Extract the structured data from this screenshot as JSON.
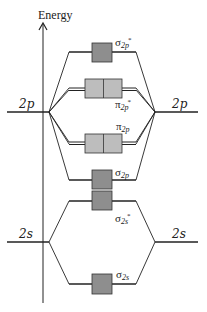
{
  "axis": {
    "title": "Energy"
  },
  "atomic_orbitals": {
    "left_2p": "2p",
    "right_2p": "2p",
    "left_2s": "2s",
    "right_2s": "2s"
  },
  "molecular_orbitals": [
    {
      "id": "sigma_2p_star",
      "symbol": "σ",
      "sub": "2p",
      "sup": "*",
      "type": "antibonding",
      "degeneracy": 1
    },
    {
      "id": "pi_2p_star",
      "symbol": "π",
      "sub": "2p",
      "sup": "*",
      "type": "antibonding",
      "degeneracy": 2
    },
    {
      "id": "pi_2p",
      "symbol": "π",
      "sub": "2p",
      "sup": "",
      "type": "bonding",
      "degeneracy": 2
    },
    {
      "id": "sigma_2p",
      "symbol": "σ",
      "sub": "2p",
      "sup": "",
      "type": "bonding",
      "degeneracy": 1
    },
    {
      "id": "sigma_2s_star",
      "symbol": "σ",
      "sub": "2s",
      "sup": "*",
      "type": "antibonding",
      "degeneracy": 1
    },
    {
      "id": "sigma_2s",
      "symbol": "σ",
      "sub": "2s",
      "sup": "",
      "type": "bonding",
      "degeneracy": 1
    }
  ],
  "colors": {
    "line": "#222222",
    "sigma_box": "#8e8e8e",
    "pi_box": "#bdbdbd",
    "box_border": "#333333"
  }
}
